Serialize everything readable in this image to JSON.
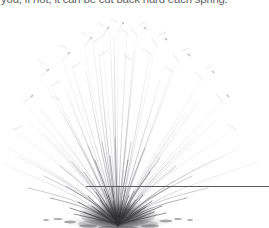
{
  "page": {
    "width": 269,
    "height": 228,
    "background_color": "#ffffff"
  },
  "caption": {
    "text": "you, if not, it can be cut back hard each spring.",
    "color": "#4a4a4a",
    "clipped_at_top": "true"
  },
  "figure": {
    "cut_line": {
      "label": "pruning cut guide line",
      "color": "#5b5b5b",
      "y": 186,
      "x_start": 86,
      "x_end": 269
    },
    "base": {
      "center_x": 118,
      "ground_y": 223,
      "clump_left": 72,
      "clump_right": 166,
      "color_dark": "#3b3b3b",
      "color_shadow": "#9a9a9a"
    },
    "stems": {
      "color_light": "#c9c9cf",
      "color_mid": "#9c9ca6",
      "color_dark": "#6e6e78",
      "count_hint": "many"
    }
  }
}
